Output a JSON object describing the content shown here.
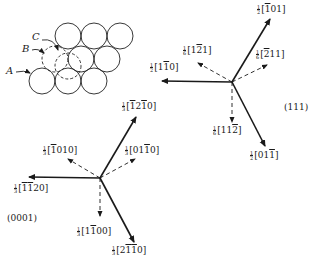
{
  "packing_sketch": {
    "labels": [
      "A",
      "B",
      "C"
    ]
  },
  "fcc_111": {
    "plane_label": "(111)",
    "vectors": [
      {
        "id": "b-101",
        "coef": [
          "1",
          "2"
        ],
        "indices": [
          {
            "t": "1",
            "bar": true
          },
          {
            "t": "0"
          },
          {
            "t": "1"
          }
        ],
        "style": "solid"
      },
      {
        "id": "b1-10",
        "coef": [
          "1",
          "2"
        ],
        "indices": [
          {
            "t": "1"
          },
          {
            "t": "1",
            "bar": true
          },
          {
            "t": "0"
          }
        ],
        "style": "solid"
      },
      {
        "id": "b01-1",
        "coef": [
          "1",
          "2"
        ],
        "indices": [
          {
            "t": "0"
          },
          {
            "t": "1"
          },
          {
            "t": "1",
            "bar": true
          }
        ],
        "style": "solid"
      },
      {
        "id": "p1-21",
        "coef": [
          "1",
          "6"
        ],
        "indices": [
          {
            "t": "1"
          },
          {
            "t": "2",
            "bar": true
          },
          {
            "t": "1"
          }
        ],
        "style": "dashed"
      },
      {
        "id": "p-211",
        "coef": [
          "1",
          "6"
        ],
        "indices": [
          {
            "t": "2",
            "bar": true
          },
          {
            "t": "1"
          },
          {
            "t": "1"
          }
        ],
        "style": "dashed"
      },
      {
        "id": "p11-2",
        "coef": [
          "1",
          "6"
        ],
        "indices": [
          {
            "t": "1"
          },
          {
            "t": "1"
          },
          {
            "t": "2",
            "bar": true
          }
        ],
        "style": "dashed"
      }
    ]
  },
  "hcp_0001": {
    "plane_label": "(0001)",
    "vectors": [
      {
        "id": "b-12-10",
        "coef": [
          "1",
          "3"
        ],
        "indices": [
          {
            "t": "1",
            "bar": true
          },
          {
            "t": "2"
          },
          {
            "t": "1",
            "bar": true
          },
          {
            "t": "0"
          }
        ],
        "style": "solid"
      },
      {
        "id": "b-1-120",
        "coef": [
          "1",
          "3"
        ],
        "indices": [
          {
            "t": "1",
            "bar": true
          },
          {
            "t": "1",
            "bar": true
          },
          {
            "t": "2"
          },
          {
            "t": "0"
          }
        ],
        "style": "solid"
      },
      {
        "id": "b2-1-10",
        "coef": [
          "1",
          "3"
        ],
        "indices": [
          {
            "t": "2"
          },
          {
            "t": "1",
            "bar": true
          },
          {
            "t": "1",
            "bar": true
          },
          {
            "t": "0"
          }
        ],
        "style": "solid"
      },
      {
        "id": "p-1010",
        "coef": [
          "1",
          "3"
        ],
        "indices": [
          {
            "t": "1",
            "bar": true
          },
          {
            "t": "0"
          },
          {
            "t": "1"
          },
          {
            "t": "0"
          }
        ],
        "style": "dashed"
      },
      {
        "id": "p01-10",
        "coef": [
          "1",
          "3"
        ],
        "indices": [
          {
            "t": "0"
          },
          {
            "t": "1"
          },
          {
            "t": "1",
            "bar": true
          },
          {
            "t": "0"
          }
        ],
        "style": "dashed"
      },
      {
        "id": "p1-100",
        "coef": [
          "1",
          "3"
        ],
        "indices": [
          {
            "t": "1"
          },
          {
            "t": "1",
            "bar": true
          },
          {
            "t": "0"
          },
          {
            "t": "0"
          }
        ],
        "style": "dashed"
      }
    ]
  },
  "colors": {
    "ink": "#1a1a1a",
    "background": "#ffffff"
  }
}
